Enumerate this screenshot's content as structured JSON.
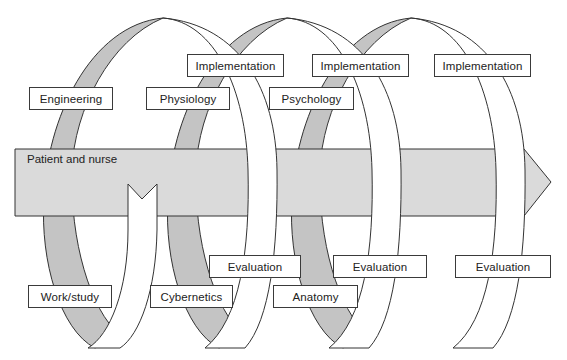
{
  "diagram": {
    "type": "spiral-flow",
    "colors": {
      "ribbon_back": "#c4c4c4",
      "ribbon_front": "#ffffff",
      "band_fill": "#dadada",
      "stroke": "#333333"
    },
    "band": {
      "label": "Patient and nurse"
    },
    "top_labels": [
      {
        "text": "Engineering"
      },
      {
        "text": "Physiology"
      },
      {
        "text": "Psychology"
      }
    ],
    "implementation_labels": [
      {
        "text": "Implementation"
      },
      {
        "text": "Implementation"
      },
      {
        "text": "Implementation"
      }
    ],
    "bottom_labels": [
      {
        "text": "Work/study"
      },
      {
        "text": "Cybernetics"
      },
      {
        "text": "Anatomy"
      }
    ],
    "evaluation_labels": [
      {
        "text": "Evaluation"
      },
      {
        "text": "Evaluation"
      },
      {
        "text": "Evaluation"
      }
    ]
  }
}
